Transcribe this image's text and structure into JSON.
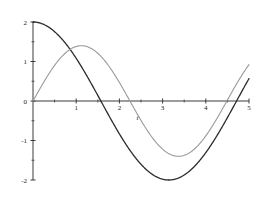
{
  "chart_data": {
    "type": "line",
    "title": "",
    "subtitle": "",
    "xlabel": "t",
    "ylabel": "",
    "xlim": [
      0,
      5
    ],
    "ylim": [
      -2,
      2
    ],
    "grid": false,
    "legend": "none",
    "x_ticks": [
      1,
      2,
      3,
      4,
      5
    ],
    "x_tick_labels": [
      "1",
      "2",
      "3",
      "4",
      "5"
    ],
    "x_minor_ticks": [
      0.5,
      1.5,
      2.5,
      3.5,
      4.5
    ],
    "y_ticks": [
      -2,
      -1,
      0,
      1,
      2
    ],
    "y_tick_labels": [
      "-2",
      "-1",
      "0",
      "1",
      "2"
    ],
    "y_minor_ticks": [
      -1.5,
      -0.5,
      0.5,
      1.5
    ],
    "axis_color": "#3b3b3b",
    "series": [
      {
        "name": "2 cos(t)",
        "color": "#2b2b2b",
        "amplitude": 2,
        "omega": 1,
        "phase": 1.5707963,
        "linewidth": 1.3,
        "x": [
          0,
          0.25,
          0.5,
          0.75,
          1,
          1.25,
          1.5,
          1.5708,
          1.75,
          2,
          2.25,
          2.5,
          2.75,
          3,
          3.1416,
          3.25,
          3.5,
          3.75,
          4,
          4.25,
          4.5,
          4.7124,
          5
        ],
        "values": [
          2,
          1.938,
          1.755,
          1.463,
          1.081,
          0.63,
          0.141,
          0,
          -0.357,
          -0.832,
          -1.26,
          -1.602,
          -1.849,
          -1.98,
          -2,
          -1.995,
          -1.873,
          -1.641,
          -1.307,
          -0.891,
          -0.422,
          0,
          0.567
        ]
      },
      {
        "name": "1.4 sin(1.4 t)",
        "color": "#9a9a9a",
        "amplitude": 1.4,
        "omega": 1.4,
        "phase": 0,
        "linewidth": 1.1,
        "x": [
          0,
          0.25,
          0.5,
          0.75,
          1,
          1.122,
          1.25,
          1.5,
          1.75,
          2,
          2.244,
          2.5,
          2.75,
          3,
          3.25,
          3.366,
          3.5,
          3.75,
          4,
          4.25,
          4.488,
          4.75,
          5
        ],
        "values": [
          0,
          0.479,
          0.897,
          1.204,
          1.371,
          1.4,
          1.385,
          1.234,
          0.949,
          0.565,
          0,
          -0.415,
          -0.842,
          -1.161,
          -1.357,
          -1.4,
          -1.389,
          -1.257,
          -0.986,
          -0.613,
          -0.157,
          0.321,
          0.976
        ]
      }
    ],
    "annotations": []
  }
}
